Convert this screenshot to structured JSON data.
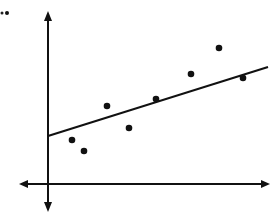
{
  "chart_data": {
    "type": "scatter",
    "title": "",
    "xlabel": "",
    "ylabel": "",
    "grid": false,
    "legend": null,
    "axes_style": "double-arrow number-line axes, no tick labels",
    "points": [
      {
        "x": 72,
        "y": 140
      },
      {
        "x": 84,
        "y": 151
      },
      {
        "x": 107,
        "y": 106
      },
      {
        "x": 129,
        "y": 128
      },
      {
        "x": 156,
        "y": 99
      },
      {
        "x": 191,
        "y": 74
      },
      {
        "x": 219,
        "y": 48
      },
      {
        "x": 243,
        "y": 78
      }
    ],
    "trend_line": {
      "x1": 48,
      "y1": 136,
      "x2": 268,
      "y2": 67
    },
    "x_axis": {
      "y": 184,
      "x_start": 19,
      "x_end": 270
    },
    "y_axis": {
      "x": 48,
      "y_start": 11,
      "y_end": 213
    },
    "coordinate_note": "pixel coordinates within the 273x213 image (y increases downward)",
    "colors": {
      "ink": "#111111",
      "background": "#ffffff"
    }
  }
}
